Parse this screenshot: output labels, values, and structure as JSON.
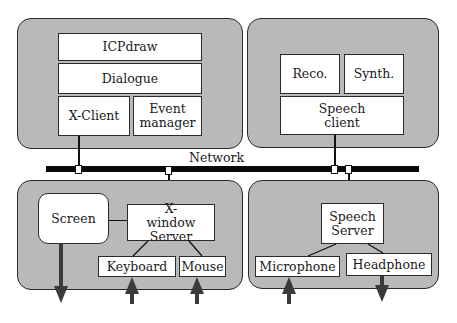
{
  "diagram": {
    "network_label": "Network",
    "workstation_top_left": {
      "modules": {
        "icpdraw": "ICPdraw",
        "dialogue": "Dialogue",
        "x_client": "X-Client",
        "event_manager": "Event manager"
      }
    },
    "workstation_top_right": {
      "modules": {
        "reco": "Reco.",
        "synth": "Synth.",
        "speech_client": "Speech client"
      }
    },
    "workstation_bottom_left": {
      "modules": {
        "screen": "Screen",
        "x_window_server": "X-window Server",
        "keyboard": "Keyboard",
        "mouse": "Mouse"
      },
      "io_arrows": [
        {
          "device": "Screen",
          "direction": "out"
        },
        {
          "device": "Keyboard",
          "direction": "in"
        },
        {
          "device": "Mouse",
          "direction": "in"
        }
      ]
    },
    "workstation_bottom_right": {
      "modules": {
        "speech_server": "Speech Server",
        "microphone": "Microphone",
        "headphone": "Headphone"
      },
      "io_arrows": [
        {
          "device": "Microphone",
          "direction": "in"
        },
        {
          "device": "Headphone",
          "direction": "out"
        }
      ]
    },
    "colors": {
      "panel_fill": "#b9b9b9",
      "box_fill": "#ffffff",
      "network_bus": "#0a0a0a",
      "arrow": "#3a3a3a"
    }
  }
}
